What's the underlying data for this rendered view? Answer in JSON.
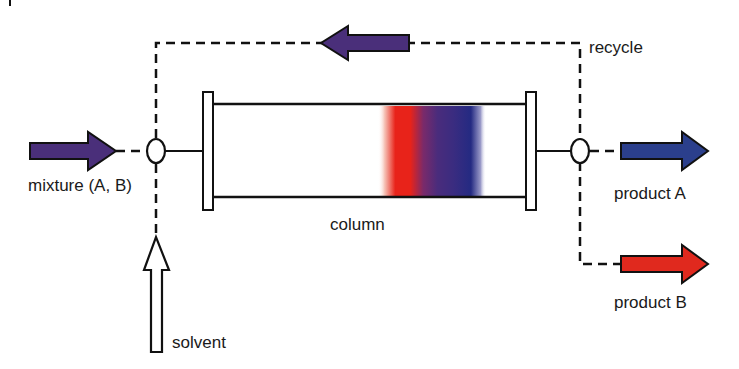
{
  "diagram": {
    "type": "recycling chromatography flow diagram",
    "labels": {
      "mixture": "mixture (A, B)",
      "recycle": "recycle",
      "column": "column",
      "product_a": "product A",
      "product_b": "product B",
      "solvent": "solvent"
    },
    "colors": {
      "mixture_arrow": "#4a2f7a",
      "recycle_arrow": "#4a2f7a",
      "product_a_arrow": "#2b3f8c",
      "product_b_arrow": "#e0291e",
      "band_red": "#e8231a",
      "band_purple": "#4a2c7c",
      "band_blue": "#242a82",
      "line": "#111111"
    },
    "nodes": [
      {
        "id": "mixture-input",
        "label": "mixture (A, B)"
      },
      {
        "id": "inlet-valve"
      },
      {
        "id": "column",
        "label": "column"
      },
      {
        "id": "outlet-valve"
      },
      {
        "id": "product-a-output",
        "label": "product A"
      },
      {
        "id": "product-b-output",
        "label": "product B"
      },
      {
        "id": "solvent-input",
        "label": "solvent"
      }
    ],
    "edges": [
      {
        "from": "mixture-input",
        "to": "inlet-valve",
        "style": "dashed"
      },
      {
        "from": "solvent-input",
        "to": "inlet-valve",
        "style": "dashed"
      },
      {
        "from": "inlet-valve",
        "to": "column",
        "style": "solid"
      },
      {
        "from": "column",
        "to": "outlet-valve",
        "style": "solid"
      },
      {
        "from": "outlet-valve",
        "to": "product-a-output",
        "style": "dashed"
      },
      {
        "from": "outlet-valve",
        "to": "product-b-output",
        "style": "dashed"
      },
      {
        "from": "outlet-valve",
        "to": "inlet-valve",
        "style": "dashed",
        "label": "recycle"
      }
    ]
  }
}
